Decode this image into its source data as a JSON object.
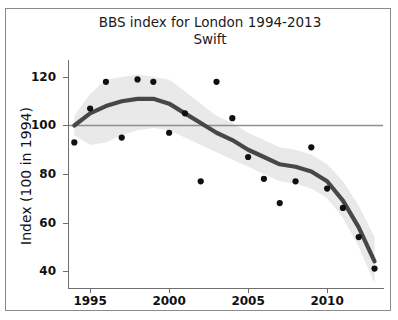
{
  "figure": {
    "title": "BBS index for London 1994-2013\nSwift",
    "title_line1": "BBS index for London 1994-2013",
    "title_line2": "Swift",
    "footer_note": ""
  },
  "axes": {
    "ylabel": "Index (100 in 1994)",
    "xlabel": "",
    "yticks": [
      40,
      60,
      80,
      100,
      120
    ],
    "ytick_labels": [
      "40",
      "60",
      "80",
      "100",
      "120"
    ],
    "xticks": [
      1995,
      2000,
      2005,
      2010
    ],
    "xtick_labels": [
      "1995",
      "2000",
      "2005",
      "2010"
    ]
  },
  "colors": {
    "point": "#101010",
    "trend_line": "#474747",
    "confidence_band": "#e9e9e9",
    "reference_line": "#8f8f8f",
    "axis": "#6e6e6e",
    "frame": "#8a8a8a",
    "background": "#ffffff"
  },
  "chart_data": {
    "type": "scatter",
    "title": "BBS index for London 1994-2013 Swift",
    "subtitle": "Swift",
    "xlabel": "",
    "ylabel": "Index (100 in 1994)",
    "xlim": [
      1993.6,
      2013.6
    ],
    "ylim": [
      33,
      127
    ],
    "grid": false,
    "legend": "none",
    "x": [
      1994,
      1995,
      1996,
      1997,
      1998,
      1999,
      2000,
      2001,
      2002,
      2003,
      2004,
      2005,
      2006,
      2007,
      2008,
      2009,
      2010,
      2011,
      2012,
      2013
    ],
    "series": [
      {
        "name": "BBS index (annual points)",
        "type": "scatter",
        "values": [
          93,
          107,
          118,
          95,
          119,
          118,
          97,
          105,
          77,
          118,
          103,
          87,
          78,
          68,
          77,
          91,
          74,
          66,
          54,
          41
        ]
      },
      {
        "name": "Smoothed trend",
        "type": "line",
        "x": [
          1994,
          1995,
          1996,
          1997,
          1998,
          1999,
          2000,
          2001,
          2002,
          2003,
          2004,
          2005,
          2006,
          2007,
          2008,
          2009,
          2010,
          2011,
          2012,
          2013
        ],
        "values": [
          100,
          105,
          108,
          110,
          111,
          111,
          109,
          105,
          101,
          97,
          94,
          90,
          87,
          84,
          83,
          81,
          77,
          69,
          58,
          44
        ]
      },
      {
        "name": "Confidence band upper",
        "type": "band",
        "x": [
          1994,
          1995,
          1996,
          1997,
          1998,
          1999,
          2000,
          2001,
          2002,
          2003,
          2004,
          2005,
          2006,
          2007,
          2008,
          2009,
          2010,
          2011,
          2012,
          2013
        ],
        "values": [
          104,
          113,
          119,
          120,
          121,
          120,
          119,
          114,
          109,
          104,
          101,
          97,
          94,
          91,
          90,
          88,
          84,
          77,
          67,
          54
        ]
      },
      {
        "name": "Confidence band lower",
        "type": "band",
        "x": [
          1994,
          1995,
          1996,
          1997,
          1998,
          1999,
          2000,
          2001,
          2002,
          2003,
          2004,
          2005,
          2006,
          2007,
          2008,
          2009,
          2010,
          2011,
          2012,
          2013
        ],
        "values": [
          96,
          92,
          93,
          96,
          98,
          99,
          98,
          95,
          92,
          89,
          86,
          83,
          80,
          77,
          76,
          74,
          70,
          62,
          50,
          35
        ]
      }
    ],
    "reference_line": {
      "orientation": "horizontal",
      "value": 100,
      "label": "baseline index 100"
    }
  }
}
